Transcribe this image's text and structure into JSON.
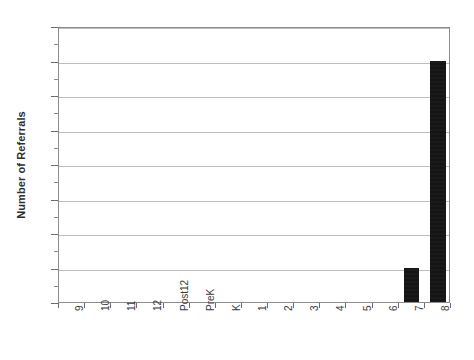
{
  "chart_data": {
    "type": "bar",
    "title": "",
    "subtitle": "",
    "xlabel": "",
    "ylabel": "Number of Referrals",
    "categories": [
      "9",
      "10",
      "11",
      "12",
      "Post12",
      "PreK",
      "K",
      "1",
      "2",
      "3",
      "4",
      "5",
      "6",
      "7",
      "8"
    ],
    "values": [
      0,
      0,
      0,
      0,
      0,
      0,
      0,
      0,
      0,
      0,
      0,
      0,
      0,
      1,
      7
    ],
    "ylim": [
      0,
      8
    ],
    "ytick_step": 1,
    "ytick_labels": [
      "0.0",
      "1.0",
      "2.0",
      "3.0",
      "4.0",
      "5.0",
      "6.0",
      "7.0",
      "8.0"
    ],
    "ytick_values": [
      0,
      1,
      2,
      3,
      4,
      5,
      6,
      7,
      8
    ],
    "minor_ticks_per_interval": 1,
    "grid": "horizontal",
    "legend": "none",
    "bar_color": "#111111",
    "gridline_color": "#bdbdbd",
    "axis_color": "#8c8c8c",
    "background": "#ffffff",
    "xtick_label_rotation": -90,
    "annotations": []
  }
}
